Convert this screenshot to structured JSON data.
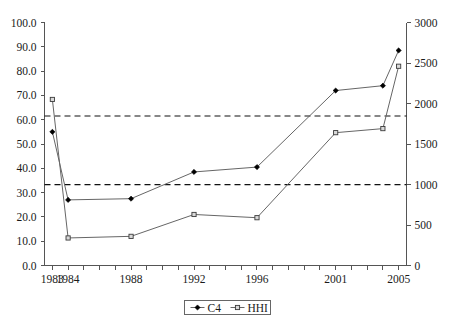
{
  "chart_data": {
    "type": "line",
    "title": "",
    "subtitle": "",
    "xlabel": "",
    "ylabel": "",
    "y2label": "",
    "grid": false,
    "legend_position": "bottom-center",
    "x": [
      1983,
      1984,
      1988,
      1992,
      1996,
      2001,
      2004,
      2005
    ],
    "categories": [
      "1983",
      "1984",
      "1988",
      "1992",
      "1996",
      "2001",
      "2004",
      "2005"
    ],
    "xlim": [
      1982.5,
      2005.5
    ],
    "ylim": [
      0,
      100
    ],
    "y2lim": [
      0,
      3000
    ],
    "x_tick_labels": [
      "1983",
      "1984",
      "1988",
      "1992",
      "1996",
      "2001",
      "2005"
    ],
    "x_tick_values": [
      1983,
      1984,
      1988,
      1992,
      1996,
      2001,
      2005
    ],
    "y_tick_labels": [
      "0.0",
      "10.0",
      "20.0",
      "30.0",
      "40.0",
      "50.0",
      "60.0",
      "70.0",
      "80.0",
      "90.0",
      "100.0"
    ],
    "y_tick_values": [
      0,
      10,
      20,
      30,
      40,
      50,
      60,
      70,
      80,
      90,
      100
    ],
    "y2_tick_labels": [
      "0",
      "500",
      "1000",
      "1500",
      "2000",
      "2500",
      "3000"
    ],
    "y2_tick_values": [
      0,
      500,
      1000,
      1500,
      2000,
      2500,
      3000
    ],
    "series": [
      {
        "name": "C4",
        "axis": "left",
        "marker": "filled-diamond",
        "color": "#000000",
        "values": [
          55.0,
          27.0,
          27.5,
          38.5,
          40.5,
          72.0,
          74.0,
          88.5
        ]
      },
      {
        "name": "HHI",
        "axis": "right",
        "marker": "open-square",
        "color": "#3a3a3a",
        "values": [
          2050,
          340,
          360,
          630,
          590,
          1640,
          1690,
          2460
        ]
      }
    ],
    "reference_lines": [
      {
        "name": "upper-threshold",
        "left_value": 61.5,
        "right_value": 1845,
        "style": "dashed"
      },
      {
        "name": "lower-threshold",
        "left_value": 33.3,
        "right_value": 1000,
        "style": "dashed"
      }
    ],
    "annotations": []
  },
  "legend": {
    "items": [
      {
        "label": "C4",
        "marker": "filled-diamond"
      },
      {
        "label": "HHI",
        "marker": "open-square"
      }
    ]
  },
  "axes": {
    "left": {
      "ticks": [
        "100.0",
        "90.0",
        "80.0",
        "70.0",
        "60.0",
        "50.0",
        "40.0",
        "30.0",
        "20.0",
        "10.0",
        "0.0"
      ]
    },
    "right": {
      "ticks": [
        "3000",
        "2500",
        "2000",
        "1500",
        "1000",
        "500",
        "0"
      ]
    },
    "bottom": {
      "ticks": [
        "1983",
        "1984",
        "1988",
        "1992",
        "1996",
        "2001",
        "2005"
      ]
    }
  },
  "caption": {
    "text": ""
  },
  "colors": {
    "axis": "#555555",
    "series_line": "#666666",
    "reference_line": "#111111",
    "background": "#ffffff",
    "text": "#1a1a1a"
  }
}
